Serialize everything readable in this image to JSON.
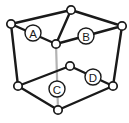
{
  "figure": {
    "type": "line-diagram",
    "canvas": {
      "width": 129,
      "height": 123,
      "background": "#ffffff"
    },
    "style": {
      "edge_color": "#1a1a1a",
      "hidden_edge_color": "#b3b3b3",
      "vertex_fill": "#ffffff",
      "vertex_stroke": "#1a1a1a",
      "label_fill": "#ffffff",
      "label_stroke": "#1a1a1a",
      "label_text_color": "#1a1a1a"
    },
    "vertices": [
      {
        "id": "top-back",
        "name": "vertex-top-back",
        "x": 71,
        "y": 10,
        "r": 4.2
      },
      {
        "id": "left-back",
        "name": "vertex-left-back",
        "x": 11,
        "y": 24,
        "r": 4.2
      },
      {
        "id": "right-back",
        "name": "vertex-right-back",
        "x": 122,
        "y": 26,
        "r": 4.2
      },
      {
        "id": "center-front",
        "name": "vertex-center-front",
        "x": 56,
        "y": 44,
        "r": 4.2
      },
      {
        "id": "mid-right",
        "name": "vertex-mid-right",
        "x": 70,
        "y": 66,
        "r": 4.2
      },
      {
        "id": "bottom-left",
        "name": "vertex-bottom-left",
        "x": 18,
        "y": 86,
        "r": 4.2
      },
      {
        "id": "bottom-right",
        "name": "vertex-bottom-right",
        "x": 113,
        "y": 86,
        "r": 4.2
      },
      {
        "id": "bottom-front",
        "name": "vertex-bottom-front",
        "x": 58,
        "y": 110,
        "r": 4.2
      }
    ],
    "edges": [
      {
        "name": "edge-top-back-to-left-back",
        "from": "top-back",
        "to": "left-back",
        "hidden": false
      },
      {
        "name": "edge-top-back-to-right-back",
        "from": "top-back",
        "to": "right-back",
        "hidden": false
      },
      {
        "name": "edge-top-back-to-center-front",
        "from": "top-back",
        "to": "center-front",
        "hidden": false
      },
      {
        "name": "edge-left-back-to-center-front",
        "from": "left-back",
        "to": "center-front",
        "hidden": false
      },
      {
        "name": "edge-center-front-to-right-back",
        "from": "center-front",
        "to": "right-back",
        "hidden": false
      },
      {
        "name": "edge-left-back-to-bottom-left",
        "from": "left-back",
        "to": "bottom-left",
        "hidden": false
      },
      {
        "name": "edge-right-back-to-bottom-right",
        "from": "right-back",
        "to": "bottom-right",
        "hidden": false
      },
      {
        "name": "edge-center-front-to-bottom-front",
        "from": "center-front",
        "to": "bottom-front",
        "hidden": true
      },
      {
        "name": "edge-bottom-left-to-mid-right",
        "from": "bottom-left",
        "to": "mid-right",
        "hidden": false
      },
      {
        "name": "edge-mid-right-to-bottom-right",
        "from": "mid-right",
        "to": "bottom-right",
        "hidden": false
      },
      {
        "name": "edge-bottom-left-to-bottom-front",
        "from": "bottom-left",
        "to": "bottom-front",
        "hidden": false
      },
      {
        "name": "edge-bottom-front-to-bottom-right",
        "from": "bottom-front",
        "to": "bottom-right",
        "hidden": false
      }
    ],
    "labels": [
      {
        "id": "A",
        "name": "label-badge-a",
        "text": "A",
        "x": 33,
        "y": 33,
        "r": 8.0
      },
      {
        "id": "B",
        "name": "label-badge-b",
        "text": "B",
        "x": 86,
        "y": 36,
        "r": 8.0
      },
      {
        "id": "C",
        "name": "label-badge-c",
        "text": "C",
        "x": 57,
        "y": 89,
        "r": 8.0
      },
      {
        "id": "D",
        "name": "label-badge-d",
        "text": "D",
        "x": 93,
        "y": 77,
        "r": 8.0
      }
    ]
  }
}
